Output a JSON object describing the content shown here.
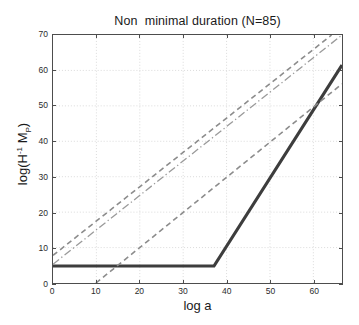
{
  "chart_data": {
    "type": "line",
    "title": "Non  minimal duration (N=85)",
    "xlabel": "log a",
    "ylabel_text": "log(H",
    "ylabel_sup": "-1",
    "ylabel_mid": " M",
    "ylabel_sub": "P",
    "ylabel_end": ")",
    "ylabel_plain": "log(H -1 M P)",
    "xlim": [
      0,
      66.6
    ],
    "ylim": [
      0,
      70
    ],
    "xticks": [
      0,
      10,
      20,
      30,
      40,
      50,
      60
    ],
    "yticks": [
      0,
      10,
      20,
      30,
      40,
      50,
      60,
      70
    ],
    "grid": true,
    "grid_style": "dotted",
    "legend": "none",
    "series": [
      {
        "name": "horizon-solid",
        "style": "solid",
        "color": "#3d3d3d",
        "width": 3.2,
        "points": [
          [
            0,
            4.8
          ],
          [
            37.1,
            4.8
          ],
          [
            66.6,
            61.5
          ]
        ]
      },
      {
        "name": "upper-dashed",
        "style": "dashed",
        "color": "#8c8c8c",
        "width": 1.6,
        "points": [
          [
            0,
            7.8
          ],
          [
            64.2,
            70
          ]
        ]
      },
      {
        "name": "middle-dashdot",
        "style": "dashdot",
        "color": "#9a9a9a",
        "width": 1.3,
        "points": [
          [
            0,
            5.3
          ],
          [
            66.6,
            70
          ]
        ]
      },
      {
        "name": "lower-dashed",
        "style": "dashed",
        "color": "#8c8c8c",
        "width": 1.6,
        "points": [
          [
            9.9,
            0
          ],
          [
            66.6,
            56.2
          ]
        ]
      }
    ]
  },
  "axis": {
    "xtick_labels": [
      "0",
      "10",
      "20",
      "30",
      "40",
      "50",
      "60"
    ],
    "ytick_labels": [
      "0",
      "10",
      "20",
      "30",
      "40",
      "50",
      "60",
      "70"
    ]
  },
  "colors": {
    "axis": "#4d4d4d",
    "grid": "#d2d2d2",
    "solid_series": "#3d3d3d",
    "dashed_series": "#8c8c8c",
    "background": "#ffffff",
    "text": "#1a1a1a"
  }
}
